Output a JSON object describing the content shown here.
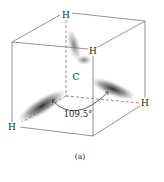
{
  "figure": {
    "atoms": {
      "top": "H",
      "front_top": "H",
      "right": "H",
      "bottom_left": "H",
      "center": "C"
    },
    "angle_label": "109.5°",
    "caption": "(a)"
  },
  "colors": {
    "line": "#555555",
    "orbital": "#333333",
    "text": "#222222"
  }
}
